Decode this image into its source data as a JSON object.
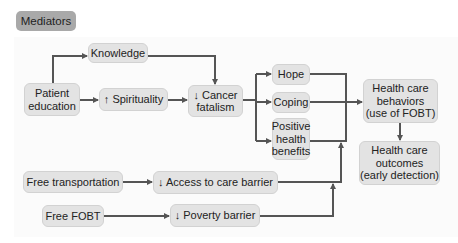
{
  "header": {
    "badge": "Mediators"
  },
  "nodes": {
    "patient_education": "Patient\neducation",
    "knowledge": "Knowledge",
    "spirituality": "↑ Spirituality",
    "cancer_fatalism": "↓ Cancer\nfatalism",
    "hope": "Hope",
    "coping": "Coping",
    "positive_health_benefits": "Positive\nhealth\nbenefits",
    "health_care_behaviors": "Health care\nbehaviors\n(use of FOBT)",
    "health_care_outcomes": "Health care\noutcomes\n(early detection)",
    "free_transportation": "Free transportation",
    "access_barrier": "↓ Access to care barrier",
    "free_fobt": "Free FOBT",
    "poverty_barrier": "↓ Poverty barrier"
  },
  "colors": {
    "box": "#e3e3e3",
    "badge": "#a9a9a9",
    "line": "#555555"
  }
}
